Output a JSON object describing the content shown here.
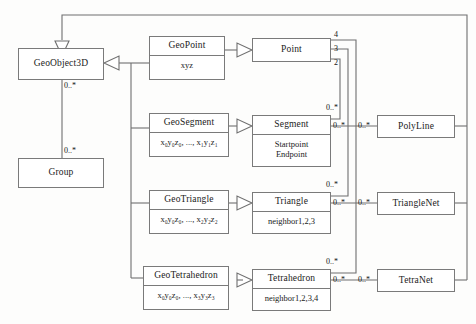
{
  "diagram": {
    "line_color": "#6f6f6f",
    "box_border_color": "#7a7a7a",
    "background": "#fdfdfc"
  },
  "classes": {
    "geoobject3d": {
      "name": "GeoObject3D"
    },
    "group": {
      "name": "Group"
    },
    "geopoint": {
      "name": "GeoPoint",
      "attr1": "xyz"
    },
    "geosegment": {
      "name": "GeoSegment",
      "attr1": "x₀y₀z₀, ..., x₁y₁z₁"
    },
    "geotriangle": {
      "name": "GeoTriangle",
      "attr1": "x₀y₀z₀, ..., x₂y₂z₂"
    },
    "geotetrahedron": {
      "name": "GeoTetrahedron",
      "attr1": "x₀y₀z₀, ..., x₃y₃z₃"
    },
    "point": {
      "name": "Point"
    },
    "segment": {
      "name": "Segment",
      "attr1": "Startpoint",
      "attr2": "Endpoint"
    },
    "triangle": {
      "name": "Triangle",
      "attr1": "neighbor1,2,3"
    },
    "tetrahedron": {
      "name": "Tetrahedron",
      "attr1": "neighbor1,2,3,4"
    },
    "polyline": {
      "name": "PolyLine"
    },
    "trianglenet": {
      "name": "TriangleNet"
    },
    "tetranet": {
      "name": "TetraNet"
    }
  },
  "multiplicities": {
    "geoobject3d_to_group_top": "0..*",
    "geoobject3d_to_group_bottom": "0..*",
    "point_4": "4",
    "point_3": "3",
    "point_2": "2",
    "segment_top": "0..*",
    "segment_right": "0..*",
    "polyline_left": "0..*",
    "triangle_top": "0..*",
    "triangle_right": "0..*",
    "trianglenet_left": "0..*",
    "tetrahedron_top": "0..*",
    "tetrahedron_right": "0..*",
    "tetranet_left": "0..*"
  }
}
